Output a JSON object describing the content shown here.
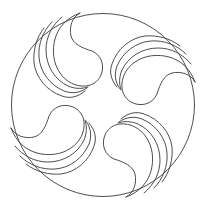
{
  "figure": {
    "stroke_color": "#3a3a3a",
    "background": "#ffffff",
    "motif_count": 4,
    "rotations_deg": [
      0,
      90,
      180,
      270
    ]
  }
}
